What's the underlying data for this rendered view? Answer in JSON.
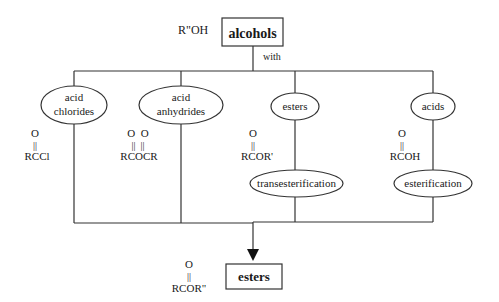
{
  "diagram": {
    "source": {
      "formula": "R\"OH",
      "label": "alcohols",
      "connector_label": "with"
    },
    "reactants": [
      {
        "name_line1": "acid",
        "name_line2": "chlorides",
        "formula_top": "O",
        "formula_bond": "||",
        "formula": "RCCl",
        "process": ""
      },
      {
        "name_line1": "acid",
        "name_line2": "anhydrides",
        "formula_top": "O  O",
        "formula_bond": "||  ||",
        "formula": "RCOCR",
        "process": ""
      },
      {
        "name_line1": "esters",
        "name_line2": "",
        "formula_top": "O",
        "formula_bond": "||",
        "formula": "RCOR'",
        "process": "transesterification"
      },
      {
        "name_line1": "acids",
        "name_line2": "",
        "formula_top": "O",
        "formula_bond": "||",
        "formula": "RCOH",
        "process": "esterification"
      }
    ],
    "product": {
      "formula_top": "O",
      "formula_bond": "||",
      "formula": "RCOR\"",
      "label": "esters"
    }
  }
}
